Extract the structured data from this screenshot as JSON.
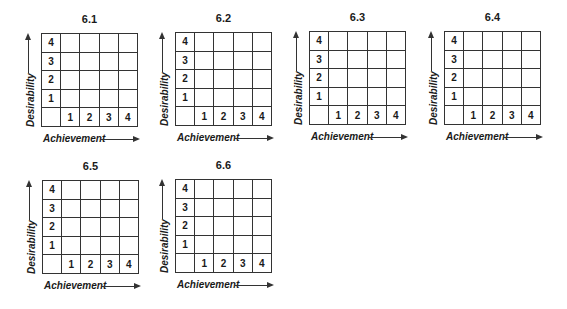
{
  "axis": {
    "y_label": "Desirability",
    "x_label": "Achievement"
  },
  "panels": [
    {
      "title": "6.1"
    },
    {
      "title": "6.2"
    },
    {
      "title": "6.3"
    },
    {
      "title": "6.4"
    },
    {
      "title": "6.5"
    },
    {
      "title": "6.6"
    }
  ],
  "grid": {
    "rows": [
      "4",
      "3",
      "2",
      "1"
    ],
    "columns": [
      "1",
      "2",
      "3",
      "4"
    ],
    "cells_empty": true
  }
}
